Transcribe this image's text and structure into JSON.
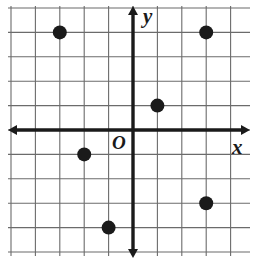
{
  "figure": {
    "kind": "coordinate-plane",
    "origin_label": "O",
    "x_axis_label": "x",
    "y_axis_label": "y",
    "background_color": "#ffffff",
    "grid_color": "#6b6b6b",
    "axis_color": "#1a1a1a",
    "point_color": "#1a1a1a"
  },
  "chart_data": {
    "type": "scatter",
    "title": "",
    "xlabel": "x",
    "ylabel": "y",
    "grid": true,
    "legend": false,
    "xlim": [
      -5,
      5
    ],
    "ylim": [
      -5,
      5
    ],
    "x_gridlines": [
      -5,
      -4,
      -3,
      -2,
      -1,
      0,
      1,
      2,
      3,
      4,
      5
    ],
    "y_gridlines": [
      -5,
      -4,
      -3,
      -2,
      -1,
      0,
      1,
      2,
      3,
      4,
      5
    ],
    "xticklabels": [],
    "yticklabels": [],
    "points": [
      {
        "name": "point-a",
        "x": -3,
        "y": 4
      },
      {
        "name": "point-b",
        "x": 3,
        "y": 4
      },
      {
        "name": "point-c",
        "x": 1,
        "y": 1
      },
      {
        "name": "point-d",
        "x": -2,
        "y": -1
      },
      {
        "name": "point-e",
        "x": 3,
        "y": -3
      },
      {
        "name": "point-f",
        "x": -1,
        "y": -4
      }
    ]
  },
  "geometry": {
    "origin_px": {
      "x": 133,
      "y": 130
    },
    "cell_px": 24.4,
    "grid_box_px": {
      "left": 8,
      "top": 6,
      "right": 250,
      "bottom": 256
    },
    "point_radius_px": 7
  }
}
